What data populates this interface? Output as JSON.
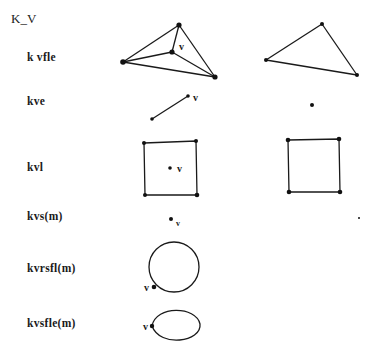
{
  "title": "K_V",
  "operations": [
    {
      "id": "kvfle",
      "label": "k vfle",
      "top": 51
    },
    {
      "id": "kve",
      "label": "kve",
      "top": 95
    },
    {
      "id": "kvl",
      "label": "kvl",
      "top": 161
    },
    {
      "id": "kvs",
      "label": "kvs(m)",
      "top": 210
    },
    {
      "id": "kvrsfl",
      "label": "kvrsfl(m)",
      "top": 262
    },
    {
      "id": "kvsfle",
      "label": "kvsfle(m)",
      "top": 317
    }
  ],
  "vertex_label": "v",
  "colors": {
    "stroke": "#1a1a1a",
    "vertex": "#111111",
    "background": "#ffffff"
  }
}
